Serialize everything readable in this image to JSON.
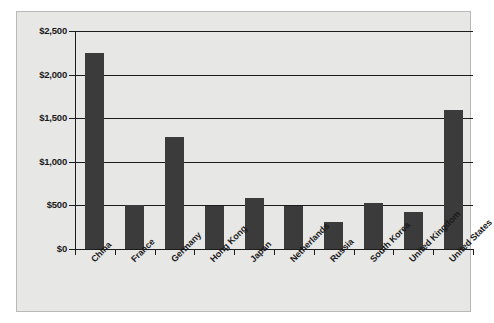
{
  "chart_data": {
    "type": "bar",
    "title": "",
    "subtitle": "",
    "xlabel": "",
    "ylabel": "",
    "categories": [
      "China",
      "France",
      "Germany",
      "Hong Kong",
      "Japan",
      "Netherlands",
      "Russia",
      "South Korea",
      "United Kingdom",
      "United States"
    ],
    "values": [
      2250,
      500,
      1280,
      490,
      590,
      495,
      310,
      525,
      425,
      1590
    ],
    "ylim": [
      0,
      2500
    ],
    "ytick_values": [
      0,
      500,
      1000,
      1500,
      2000,
      2500
    ],
    "ytick_labels": [
      "$0",
      "$500",
      "$1,000",
      "$1,500",
      "$2,000",
      "$2,500"
    ],
    "grid": true,
    "legend": false,
    "legend_position": "none",
    "series": [
      {
        "name": "Value",
        "values": [
          2250,
          500,
          1280,
          490,
          590,
          495,
          310,
          525,
          425,
          1590
        ]
      }
    ]
  },
  "style": {
    "bar_color": "#3b3b3b",
    "panel_background": "#e7e7e6",
    "page_background": "#ffffff",
    "axis_color": "#1c1c1c",
    "grid_color": "#1c1c1c",
    "text_color": "#1a1a1a"
  }
}
